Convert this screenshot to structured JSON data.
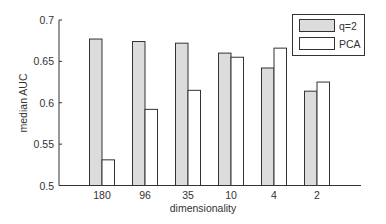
{
  "chart_data": {
    "type": "bar",
    "title": "",
    "xlabel": "dimensionality",
    "ylabel": "median AUC",
    "categories": [
      "180",
      "96",
      "35",
      "10",
      "4",
      "2"
    ],
    "series": [
      {
        "name": "q=2",
        "color": "#dcdcdc",
        "values": [
          0.677,
          0.674,
          0.672,
          0.66,
          0.642,
          0.614
        ]
      },
      {
        "name": "PCA",
        "color": "#ffffff",
        "values": [
          0.531,
          0.592,
          0.615,
          0.655,
          0.666,
          0.625
        ]
      }
    ],
    "ylim": [
      0.5,
      0.7
    ],
    "yticks": [
      "0.5",
      "0.55",
      "0.6",
      "0.65",
      "0.7"
    ],
    "ytick_values": [
      0.5,
      0.55,
      0.6,
      0.65,
      0.7
    ],
    "grid": false,
    "legend_position": "upper right",
    "bar_edge_color": "#333333"
  }
}
